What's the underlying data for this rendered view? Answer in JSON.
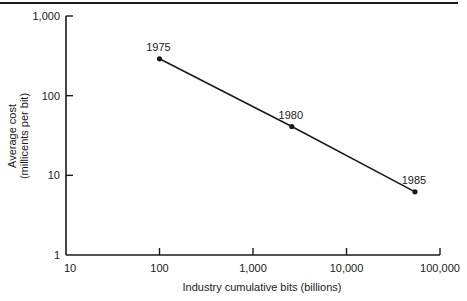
{
  "chart_data": {
    "type": "line",
    "title": "",
    "xlabel": "Industry cumulative bits (billions)",
    "ylabel": "Average cost",
    "ylabel_line2": "(millicents per bit)",
    "xscale": "log",
    "yscale": "log",
    "xlim": [
      10,
      100000
    ],
    "ylim": [
      1,
      1000
    ],
    "x_ticks": [
      "10",
      "100",
      "1,000",
      "10,000",
      "100,000"
    ],
    "y_ticks": [
      "1",
      "10",
      "100",
      "1,000"
    ],
    "grid": false,
    "legend": null,
    "series": [
      {
        "name": "Average cost",
        "points": [
          {
            "label": "1975",
            "x": 100,
            "y": 290
          },
          {
            "label": "1980",
            "x": 2600,
            "y": 41
          },
          {
            "label": "1985",
            "x": 54000,
            "y": 6.2
          }
        ]
      }
    ]
  },
  "x_axis": {
    "ticks": [
      {
        "value": 10,
        "label": "10"
      },
      {
        "value": 100,
        "label": "100"
      },
      {
        "value": 1000,
        "label": "1,000"
      },
      {
        "value": 10000,
        "label": "10,000"
      },
      {
        "value": 100000,
        "label": "100,000"
      }
    ],
    "title": "Industry cumulative bits (billions)"
  },
  "y_axis": {
    "ticks": [
      {
        "value": 1,
        "label": "1"
      },
      {
        "value": 10,
        "label": "10"
      },
      {
        "value": 100,
        "label": "100"
      },
      {
        "value": 1000,
        "label": "1,000"
      }
    ],
    "title_line1": "Average cost",
    "title_line2": "(millicents per bit)"
  },
  "colors": {
    "ink": "#1a1a1a",
    "background": "#ffffff"
  }
}
